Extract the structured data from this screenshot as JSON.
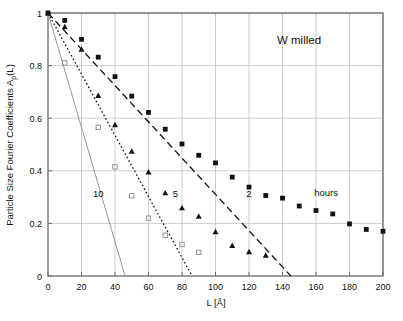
{
  "chart_data": {
    "type": "scatter",
    "title": "W  milled",
    "xlabel": "L [Å]",
    "ylabel": "Particle Size Fourier Coefficients A",
    "ylabel_sub": "p",
    "ylabel_tail": "(L)",
    "xlim": [
      0,
      200
    ],
    "ylim": [
      0,
      1
    ],
    "xticks": [
      0,
      20,
      40,
      60,
      80,
      100,
      120,
      140,
      160,
      180,
      200
    ],
    "yticks": [
      0,
      0.2,
      0.4,
      0.6,
      0.8,
      1
    ],
    "xtick_labels": [
      "0",
      "20",
      "40",
      "60",
      "80",
      "100",
      "120",
      "140",
      "160",
      "180",
      "200"
    ],
    "ytick_labels": [
      "0",
      "0.2",
      "0.4",
      "0.6",
      "0.8",
      "1"
    ],
    "grid": true,
    "grid_color": "#b9b9b9",
    "frame_color": "#6a6a6a",
    "legend": "in-plot annotations",
    "annotations": [
      {
        "text": "10",
        "x": 30,
        "y": 0.3,
        "name": "series-label-10-hours"
      },
      {
        "text": "5",
        "x": 76,
        "y": 0.3,
        "name": "series-label-5-hours"
      },
      {
        "text": "2",
        "x": 120,
        "y": 0.3,
        "name": "series-label-2-hours"
      },
      {
        "text": "hours",
        "x": 166,
        "y": 0.305,
        "name": "units-label-hours"
      }
    ],
    "series": [
      {
        "name": "2",
        "label": "2 hours",
        "marker": "filled-square",
        "color": "#111111",
        "line_style": "dashed",
        "x": [
          0,
          10,
          20,
          30,
          40,
          50,
          60,
          70,
          80,
          90,
          100,
          110,
          120,
          130,
          140,
          150,
          160,
          170,
          180,
          190,
          200
        ],
        "y": [
          1.0,
          0.972,
          0.9,
          0.832,
          0.758,
          0.684,
          0.622,
          0.558,
          0.502,
          0.459,
          0.43,
          0.376,
          0.338,
          0.306,
          0.296,
          0.266,
          0.249,
          0.236,
          0.198,
          0.177,
          0.17
        ],
        "fit_line": {
          "x0": 0,
          "y0": 1.0,
          "x1": 145,
          "y1": 0.0
        }
      },
      {
        "name": "5",
        "label": "5 hours",
        "marker": "filled-triangle",
        "color": "#111111",
        "line_style": "dotted",
        "x": [
          0,
          10,
          20,
          30,
          40,
          50,
          60,
          70,
          80,
          90,
          100,
          110,
          120,
          130
        ],
        "y": [
          1.0,
          0.948,
          0.862,
          0.686,
          0.575,
          0.474,
          0.395,
          0.316,
          0.259,
          0.227,
          0.168,
          0.116,
          0.092,
          0.079
        ],
        "fit_line": {
          "x0": 0,
          "y0": 1.0,
          "x1": 86,
          "y1": 0.0
        }
      },
      {
        "name": "10",
        "label": "10 hours",
        "marker": "open-square",
        "color": "#8a8a8a",
        "line_style": "solid",
        "x": [
          10,
          30,
          40,
          50,
          60,
          70,
          80,
          90
        ],
        "y": [
          0.81,
          0.565,
          0.415,
          0.305,
          0.22,
          0.155,
          0.12,
          0.09
        ],
        "fit_line": {
          "x0": 0,
          "y0": 1.0,
          "x1": 46,
          "y1": 0.0
        }
      }
    ]
  }
}
